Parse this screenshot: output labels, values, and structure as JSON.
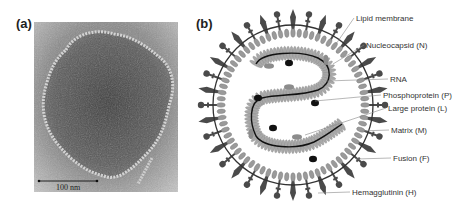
{
  "figure": {
    "panel_a": {
      "label": "(a)",
      "description": "electron micrograph of virion",
      "scale_bar": {
        "label": "100 nm"
      }
    },
    "panel_b": {
      "label": "(b)",
      "description": "schematic of paramyxovirus virion",
      "callouts": [
        {
          "id": "lipid-membrane",
          "label": "Lipid membrane",
          "tx": 356,
          "ty": 21,
          "px": 336,
          "py": 44
        },
        {
          "id": "nucleocapsid",
          "label": "Nucleocapsid (N)",
          "tx": 366,
          "ty": 48,
          "px": 333,
          "py": 64
        },
        {
          "id": "rna",
          "label": "RNA",
          "tx": 390,
          "ty": 82,
          "px": 326,
          "py": 81
        },
        {
          "id": "phosphoprotein",
          "label": "Phosphoprotein (P)",
          "tx": 383,
          "ty": 98,
          "px": 315,
          "py": 101
        },
        {
          "id": "large-protein",
          "label": "Large protein (L)",
          "tx": 388,
          "ty": 111,
          "px": 305,
          "py": 135
        },
        {
          "id": "matrix",
          "label": "Matrix (M)",
          "tx": 391,
          "ty": 133,
          "px": 360,
          "py": 131
        },
        {
          "id": "fusion",
          "label": "Fusion (F)",
          "tx": 393,
          "ty": 161,
          "px": 356,
          "py": 159
        },
        {
          "id": "hemagglutinin",
          "label": "Hemagglutinin (H)",
          "tx": 352,
          "ty": 195,
          "px": 318,
          "py": 193
        }
      ]
    },
    "colors": {
      "spike": "#4a4a4a",
      "membrane": "#333333",
      "matrix_bead": "#9a9a9a",
      "nucleocapsid_bead": "#a8a8a8",
      "rna": "#111111",
      "polymerase": "#111111",
      "phosphoprotein_blob": "#8c8c8c",
      "leader": "#888888"
    }
  }
}
